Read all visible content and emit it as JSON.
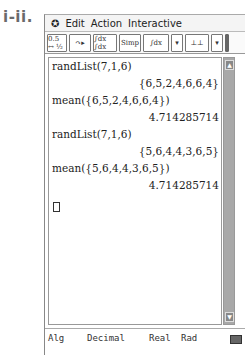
{
  "figure_label": "i-ii.",
  "menu": {
    "items": [
      "Edit",
      "Action",
      "Interactive"
    ]
  },
  "toolbar": {
    "buttons": [
      {
        "name": "fraction-decimal-toggle",
        "label": "0.5 ↔ ½"
      },
      {
        "name": "run-pointer",
        "label": "↷▸"
      },
      {
        "name": "integral-derivative",
        "label": "∫dx ∫dx"
      },
      {
        "name": "simp",
        "label": "Simp"
      },
      {
        "name": "integral-menu",
        "label": "∫dx"
      },
      {
        "name": "dropdown-1",
        "label": "▾"
      },
      {
        "name": "graph-split",
        "label": "⊥⊥"
      },
      {
        "name": "dropdown-2",
        "label": "▾"
      }
    ]
  },
  "work_area": {
    "entries": [
      {
        "input": "randList(7,1,6)",
        "output": "{6,5,2,4,6,6,4}"
      },
      {
        "input": "mean({6,5,2,4,6,6,4})",
        "output": "4.714285714"
      },
      {
        "input": "randList(7,1,6)",
        "output": "{5,6,4,4,3,6,5}"
      },
      {
        "input": "mean({5,6,4,4,3,6,5})",
        "output": "4.714285714"
      }
    ]
  },
  "status_bar": {
    "mode": "Alg",
    "number_format": "Decimal",
    "domain": "Real",
    "angle": "Rad"
  }
}
